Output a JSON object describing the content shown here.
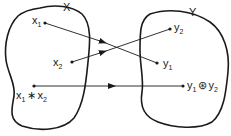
{
  "diagram": {
    "type": "mapping",
    "sets": {
      "domain": {
        "label": "X"
      },
      "codomain": {
        "label": "Y"
      }
    },
    "elements": {
      "x1": {
        "base": "x",
        "sub": "1"
      },
      "x2": {
        "base": "x",
        "sub": "2"
      },
      "x_prod": {
        "a_base": "x",
        "a_sub": "1",
        "op": "∗",
        "b_base": "x",
        "b_sub": "2"
      },
      "y1": {
        "base": "y",
        "sub": "1"
      },
      "y2": {
        "base": "y",
        "sub": "2"
      },
      "y_prod": {
        "a_base": "y",
        "a_sub": "1",
        "op": "⊛",
        "b_base": "y",
        "b_sub": "2"
      }
    },
    "mappings": [
      {
        "from": "x1",
        "to": "y1"
      },
      {
        "from": "x2",
        "to": "y2"
      },
      {
        "from": "x1 ∗ x2",
        "to": "y1 ⊛ y2"
      }
    ],
    "colors": {
      "ink": "#1a1a1a",
      "background": "#ffffff"
    }
  }
}
